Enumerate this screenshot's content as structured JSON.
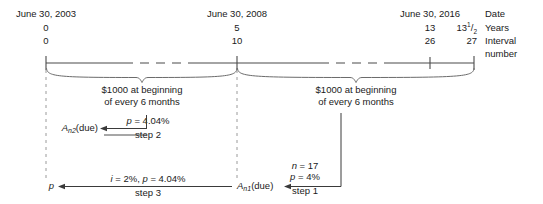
{
  "diagram": {
    "title_hidden": "Annuity due timeline with deferred annuity steps",
    "row_labels": {
      "date": "Date",
      "years": "Years",
      "interval_line1": "Interval",
      "interval_line2": "number"
    },
    "timeline_points": [
      {
        "id": "p0",
        "date": "June 30, 2003",
        "years": "0",
        "interval": "0",
        "x": 46
      },
      {
        "id": "p1",
        "date": "June 30, 2008",
        "years": "5",
        "interval": "10",
        "x": 237
      },
      {
        "id": "p2",
        "date": "June 30, 2016",
        "years": "13",
        "interval": "26",
        "x": 430
      },
      {
        "id": "p3",
        "date": "",
        "years_whole": "13",
        "years_num": "1",
        "years_den": "2",
        "interval": "27",
        "x": 474
      }
    ],
    "braces": [
      {
        "id": "brace-left",
        "label_line1": "$1000 at beginning",
        "label_line2": "of every 6 months",
        "from_x": 46,
        "to_x": 237
      },
      {
        "id": "brace-right",
        "label_line1": "$1000 at beginning",
        "label_line2": "of every 6 months",
        "from_x": 237,
        "to_x": 474
      }
    ],
    "steps": [
      {
        "id": "step-1",
        "target_base": "A",
        "target_sub": "n1",
        "target_suffix": "(due)",
        "param_line1_var": "n",
        "param_line1_val": " = 17",
        "param_line2_var": "p",
        "param_line2_val": " = 4%",
        "step_label": "step 1"
      },
      {
        "id": "step-2",
        "target_base": "A",
        "target_sub": "n2",
        "target_suffix": "(due)",
        "param_var": "p",
        "param_val": " = 4.04%",
        "step_label": "step 2"
      },
      {
        "id": "step-3",
        "target": "p",
        "param_i_var": "i",
        "param_i_val": " = 2%, ",
        "param_p_var": "p",
        "param_p_val": " = 4.04%",
        "step_label": "step 3"
      }
    ],
    "colors": {
      "ink": "#1a1a1a",
      "line": "#4a4a4a",
      "dashed": "#8c8c8c",
      "background": "#ffffff"
    }
  }
}
